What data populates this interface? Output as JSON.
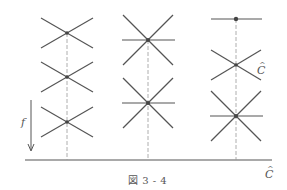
{
  "figure": {
    "caption": "図 3 - 4",
    "label_f": "f",
    "label_c_hat_right": "C",
    "label_c_hat_axis": "C",
    "hat_glyph": "^",
    "colors": {
      "stroke": "#555555",
      "dash": "#999999",
      "text": "#555555"
    }
  },
  "columns": [
    {
      "x": 67,
      "elements": [
        {
          "type": "x-cross",
          "y": 33
        },
        {
          "type": "x-cross",
          "y": 77
        },
        {
          "type": "x-cross",
          "y": 122
        }
      ]
    },
    {
      "x": 148,
      "elements": [
        {
          "type": "star-six",
          "y": 40
        },
        {
          "type": "star-six",
          "y": 103
        }
      ]
    },
    {
      "x": 236,
      "elements": [
        {
          "type": "bar-dot",
          "y": 19
        },
        {
          "type": "x-cross",
          "y": 65
        },
        {
          "type": "star-six",
          "y": 116
        }
      ]
    }
  ]
}
